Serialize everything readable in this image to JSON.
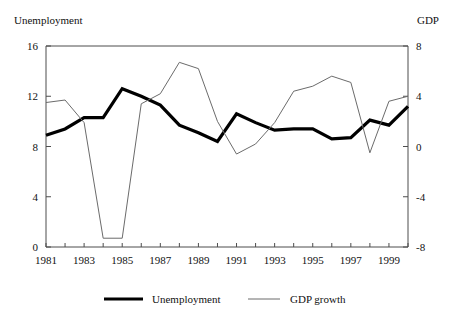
{
  "chart_data": {
    "type": "line",
    "title": "",
    "xlabel": "",
    "left_axis_title": "Unemployment",
    "right_axis_title": "GDP",
    "x": [
      1981,
      1982,
      1983,
      1984,
      1985,
      1986,
      1987,
      1988,
      1989,
      1990,
      1991,
      1992,
      1993,
      1994,
      1995,
      1996,
      1997,
      1998,
      1999,
      2000
    ],
    "xtick_labels": [
      "1981",
      "1983",
      "1985",
      "1987",
      "1989",
      "1991",
      "1993",
      "1995",
      "1997",
      "1999"
    ],
    "xtick_values": [
      1981,
      1983,
      1985,
      1987,
      1989,
      1991,
      1993,
      1995,
      1997,
      1999
    ],
    "xlim": [
      1981,
      2000
    ],
    "left_ylabel": "Unemployment",
    "left_ylim": [
      0,
      16
    ],
    "left_yticks": [
      0,
      4,
      8,
      12,
      16
    ],
    "left_ytick_labels": [
      "0",
      "4",
      "8",
      "12",
      "16"
    ],
    "right_ylabel": "GDP",
    "right_ylim": [
      -8,
      8
    ],
    "right_yticks": [
      -8,
      -4,
      0,
      4,
      8
    ],
    "right_ytick_labels": [
      "-8",
      "-4",
      "0",
      "4",
      "8"
    ],
    "grid": false,
    "legend_position": "bottom",
    "series": [
      {
        "name": "Unemployment",
        "axis": "left",
        "style": "thick-black",
        "color": "#000000",
        "values": [
          8.9,
          9.4,
          10.3,
          10.3,
          12.6,
          12.0,
          11.3,
          9.7,
          9.1,
          8.4,
          10.6,
          9.9,
          9.3,
          9.4,
          9.4,
          8.6,
          8.7,
          10.1,
          9.7,
          11.2
        ]
      },
      {
        "name": "GDP growth",
        "axis": "right",
        "style": "thin-gray",
        "color": "#6b6b6b",
        "values": [
          3.5,
          3.7,
          1.9,
          -7.3,
          -7.3,
          3.4,
          4.2,
          6.7,
          6.2,
          2.0,
          -0.6,
          0.2,
          1.9,
          4.4,
          4.8,
          5.6,
          5.1,
          -0.5,
          3.6,
          4.0
        ]
      }
    ],
    "legend": [
      {
        "label": "Unemployment",
        "style": "thick-black"
      },
      {
        "label": "GDP growth",
        "style": "thin-gray"
      }
    ]
  }
}
